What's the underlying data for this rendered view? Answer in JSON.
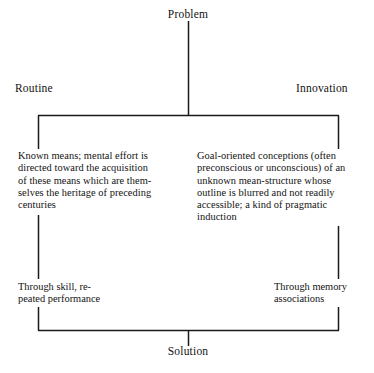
{
  "diagram": {
    "root": {
      "label": "Problem"
    },
    "terminal": {
      "label": "Solution"
    },
    "branches": [
      {
        "id": "routine",
        "heading": "Routine",
        "description_lines": [
          "Known means; mental effort is",
          "directed toward the acquisition",
          "of these means which are them-",
          "selves the heritage of preceding",
          "centuries"
        ],
        "description": "Known means; mental effort is directed toward the acquisition of these means which are themselves the heritage of preceding centuries",
        "outcome_lines": [
          "Through skill, re-",
          "peated performance"
        ],
        "outcome": "Through skill, repeated performance"
      },
      {
        "id": "innovation",
        "heading": "Innovation",
        "description_lines": [
          "Goal-oriented conceptions (often",
          "preconscious or unconscious) of an",
          "unknown mean-structure whose",
          "outline is blurred and not readily",
          "accessible; a kind of pragmatic",
          "induction"
        ],
        "description": "Goal-oriented conceptions (often preconscious or unconscious) of an unknown mean-structure whose outline is blurred and not readily accessible; a kind of pragmatic induction",
        "outcome_lines": [
          "Through memory",
          "associations"
        ],
        "outcome": "Through memory associations"
      }
    ],
    "colors": {
      "background": "#ffffff",
      "ink": "#131313",
      "line": "#1a1a1a"
    }
  }
}
